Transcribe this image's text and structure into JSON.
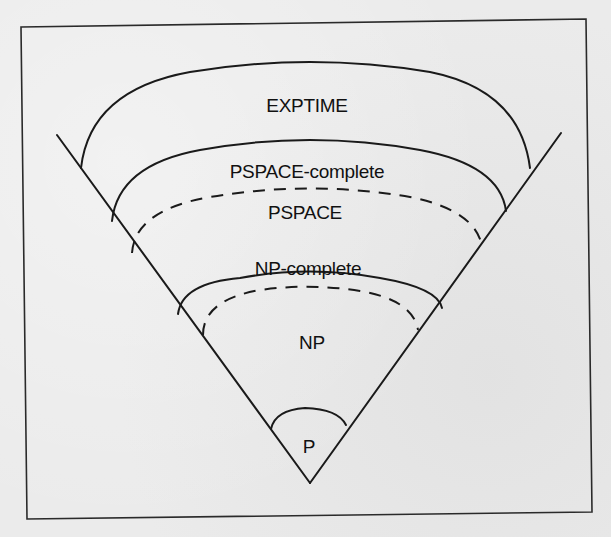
{
  "figure": {
    "regions": [
      {
        "id": "exptime",
        "label": "EXPTIME",
        "boundary": "solid"
      },
      {
        "id": "pspace-complete",
        "label": "PSPACE-complete",
        "boundary": "solid"
      },
      {
        "id": "pspace",
        "label": "PSPACE",
        "boundary": "dashed"
      },
      {
        "id": "np-complete",
        "label": "NP-complete",
        "boundary": "solid"
      },
      {
        "id": "np",
        "label": "NP",
        "boundary": "dashed"
      },
      {
        "id": "p",
        "label": "P",
        "boundary": "solid"
      }
    ],
    "colors": {
      "background": "#ebebeb",
      "ink": "#1a1a1a"
    }
  }
}
